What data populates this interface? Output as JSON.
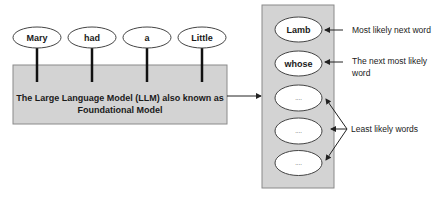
{
  "input_tokens": [
    "Mary",
    "had",
    "a",
    "Little"
  ],
  "model": {
    "line1": "The Large Language Model (LLM) also known as",
    "line2": "Foundational Model"
  },
  "output_candidates": [
    "Lamb",
    "whose",
    "....",
    "....",
    "...."
  ],
  "annotations": {
    "most_likely": "Most likely next word",
    "next_most_likely_line1": "The next most likely",
    "next_most_likely_line2": "word",
    "least_likely": "Least likely words"
  }
}
